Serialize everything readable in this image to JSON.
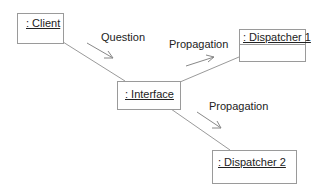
{
  "diagram": {
    "type": "UML communication diagram",
    "objects": [
      {
        "id": "client",
        "label": ": Client"
      },
      {
        "id": "interface",
        "label": ": Interface"
      },
      {
        "id": "dispatcher1",
        "label": ": Dispatcher 1"
      },
      {
        "id": "dispatcher2",
        "label": ": Dispatcher 2"
      }
    ],
    "links": [
      {
        "from": "client",
        "to": "interface"
      },
      {
        "from": "interface",
        "to": "dispatcher1"
      },
      {
        "from": "interface",
        "to": "dispatcher2"
      }
    ],
    "messages": [
      {
        "label": "Question",
        "from": "client",
        "to": "interface"
      },
      {
        "label": "Propagation",
        "from": "interface",
        "to": "dispatcher1"
      },
      {
        "label": "Propagation",
        "from": "interface",
        "to": "dispatcher2"
      }
    ],
    "colors": {
      "line": "#9a9a9a",
      "text": "#222222",
      "background": "#ffffff"
    }
  }
}
